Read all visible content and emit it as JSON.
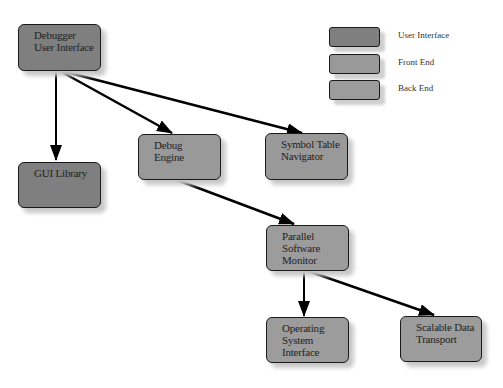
{
  "diagram": {
    "nodes": [
      {
        "id": "debugger-ui",
        "lines": [
          "Debugger",
          "User Interface"
        ],
        "category": "User Interface"
      },
      {
        "id": "gui-library",
        "lines": [
          "GUI Library"
        ],
        "category": "User Interface"
      },
      {
        "id": "debug-engine",
        "lines": [
          "Debug",
          "Engine"
        ],
        "category": "Front End"
      },
      {
        "id": "symbol-table-navigator",
        "lines": [
          "Symbol Table",
          "Navigator"
        ],
        "category": "Front End"
      },
      {
        "id": "parallel-software-monitor",
        "lines": [
          "Parallel",
          "Software",
          "Monitor"
        ],
        "category": "Back End"
      },
      {
        "id": "operating-system-interface",
        "lines": [
          "Operating",
          "System",
          "Interface"
        ],
        "category": "Back End"
      },
      {
        "id": "scalable-data-transport",
        "lines": [
          "Scalable Data",
          "Transport"
        ],
        "category": "Back End"
      }
    ],
    "edges": [
      {
        "from": "debugger-ui",
        "to": "gui-library"
      },
      {
        "from": "debugger-ui",
        "to": "debug-engine"
      },
      {
        "from": "debugger-ui",
        "to": "symbol-table-navigator"
      },
      {
        "from": "debug-engine",
        "to": "parallel-software-monitor"
      },
      {
        "from": "parallel-software-monitor",
        "to": "operating-system-interface"
      },
      {
        "from": "parallel-software-monitor",
        "to": "scalable-data-transport"
      }
    ]
  },
  "legend": {
    "items": [
      {
        "label": "User Interface",
        "color": "#7f7f7f"
      },
      {
        "label": "Front End",
        "color": "#999999"
      },
      {
        "label": "Back End",
        "color": "#9c9c9c"
      }
    ]
  }
}
